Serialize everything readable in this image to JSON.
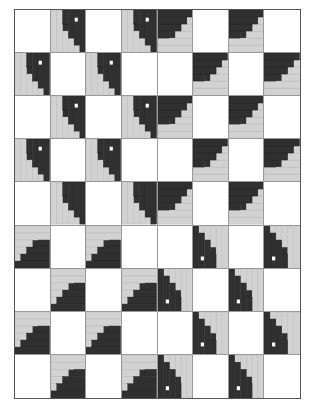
{
  "document": {
    "type": "quilt-pattern-diagram",
    "title": "Log Cabin Barn Raising Quilt Layout",
    "description": "Eight-by-nine checkerboard grid of alternating plain white setting squares and pieced log cabin blocks rotated to form a radiating barn-raising medallion."
  },
  "canvas": {
    "width": 324,
    "height": 411,
    "background": "#ffffff"
  },
  "frame": {
    "x": 14,
    "y": 9,
    "width": 287,
    "height": 390,
    "border_width": 1,
    "border_color": "#555555",
    "fill": "#ffffff"
  },
  "grid": {
    "columns": 8,
    "rows": 9,
    "cell_width": 35.875,
    "cell_height": 43.333,
    "gridlines": true,
    "gridline_color": "#9a9a9a"
  },
  "palette": {
    "white": "#ffffff",
    "light": "#d2d2d2",
    "light_edge": "#b4b4b4",
    "medium": "#8e8e8e",
    "dark": "#303030",
    "darker": "#1f1f1f",
    "outline": "#555555",
    "seam": "#9a9a9a",
    "dot": "#ffffff"
  },
  "block_types": {
    "plain": "plain white setting square",
    "log_cabin": "log cabin block, light half and dark half split on the diagonal"
  },
  "block_orientations": {
    "0": "dark corner top-right",
    "90": "dark corner bottom-right",
    "180": "dark corner bottom-left",
    "270": "dark corner top-left"
  },
  "layout": [
    [
      {
        "t": "plain"
      },
      {
        "t": "cabin",
        "rot": 0,
        "dot": true
      },
      {
        "t": "plain"
      },
      {
        "t": "cabin",
        "rot": 0,
        "dot": true
      },
      {
        "t": "cabin",
        "rot": 270,
        "dot": false
      },
      {
        "t": "plain"
      },
      {
        "t": "cabin",
        "rot": 270,
        "dot": false
      },
      {
        "t": "plain"
      }
    ],
    [
      {
        "t": "cabin",
        "rot": 0,
        "dot": true
      },
      {
        "t": "plain"
      },
      {
        "t": "cabin",
        "rot": 0,
        "dot": true
      },
      {
        "t": "plain"
      },
      {
        "t": "plain"
      },
      {
        "t": "cabin",
        "rot": 270,
        "dot": false
      },
      {
        "t": "plain"
      },
      {
        "t": "cabin",
        "rot": 270,
        "dot": false
      }
    ],
    [
      {
        "t": "plain"
      },
      {
        "t": "cabin",
        "rot": 0,
        "dot": true
      },
      {
        "t": "plain"
      },
      {
        "t": "cabin",
        "rot": 0,
        "dot": true
      },
      {
        "t": "cabin",
        "rot": 270,
        "dot": false
      },
      {
        "t": "plain"
      },
      {
        "t": "cabin",
        "rot": 270,
        "dot": false
      },
      {
        "t": "plain"
      }
    ],
    [
      {
        "t": "cabin",
        "rot": 0,
        "dot": true
      },
      {
        "t": "plain"
      },
      {
        "t": "cabin",
        "rot": 0,
        "dot": true
      },
      {
        "t": "plain"
      },
      {
        "t": "plain"
      },
      {
        "t": "cabin",
        "rot": 270,
        "dot": false
      },
      {
        "t": "plain"
      },
      {
        "t": "cabin",
        "rot": 270,
        "dot": false
      }
    ],
    [
      {
        "t": "plain"
      },
      {
        "t": "cabin",
        "rot": 0,
        "dot": false
      },
      {
        "t": "plain"
      },
      {
        "t": "cabin",
        "rot": 0,
        "dot": false
      },
      {
        "t": "cabin",
        "rot": 270,
        "dot": false
      },
      {
        "t": "plain"
      },
      {
        "t": "cabin",
        "rot": 270,
        "dot": false
      },
      {
        "t": "plain"
      }
    ],
    [
      {
        "t": "cabin",
        "rot": 90,
        "dot": false
      },
      {
        "t": "plain"
      },
      {
        "t": "cabin",
        "rot": 90,
        "dot": false
      },
      {
        "t": "plain"
      },
      {
        "t": "plain"
      },
      {
        "t": "cabin",
        "rot": 180,
        "dot": true
      },
      {
        "t": "plain"
      },
      {
        "t": "cabin",
        "rot": 180,
        "dot": true
      }
    ],
    [
      {
        "t": "plain"
      },
      {
        "t": "cabin",
        "rot": 90,
        "dot": false
      },
      {
        "t": "plain"
      },
      {
        "t": "cabin",
        "rot": 90,
        "dot": false
      },
      {
        "t": "cabin",
        "rot": 180,
        "dot": true
      },
      {
        "t": "plain"
      },
      {
        "t": "cabin",
        "rot": 180,
        "dot": true
      },
      {
        "t": "plain"
      }
    ],
    [
      {
        "t": "cabin",
        "rot": 90,
        "dot": false
      },
      {
        "t": "plain"
      },
      {
        "t": "cabin",
        "rot": 90,
        "dot": false
      },
      {
        "t": "plain"
      },
      {
        "t": "plain"
      },
      {
        "t": "cabin",
        "rot": 180,
        "dot": true
      },
      {
        "t": "plain"
      },
      {
        "t": "cabin",
        "rot": 180,
        "dot": true
      }
    ],
    [
      {
        "t": "plain"
      },
      {
        "t": "cabin",
        "rot": 90,
        "dot": false
      },
      {
        "t": "plain"
      },
      {
        "t": "cabin",
        "rot": 90,
        "dot": false
      },
      {
        "t": "cabin",
        "rot": 180,
        "dot": true
      },
      {
        "t": "plain"
      },
      {
        "t": "cabin",
        "rot": 180,
        "dot": true
      },
      {
        "t": "plain"
      }
    ]
  ],
  "log_cabin_block": {
    "unit_grid": 6,
    "note": "Block is drawn on a 6x6 unit grid. Light strips occupy the lower-left triangle half, dark strips the upper-right half, spiralling out from a small centre square.",
    "strips": [
      {
        "name": "centre-square",
        "shade": "dark",
        "x": 2,
        "y": 2,
        "w": 1,
        "h": 1
      },
      {
        "name": "log-1-light",
        "shade": "light",
        "x": 0,
        "y": 0,
        "w": 1,
        "h": 6
      },
      {
        "name": "log-2-light",
        "shade": "light",
        "x": 1,
        "y": 0,
        "w": 1,
        "h": 6
      },
      {
        "name": "log-3-light",
        "shade": "light",
        "x": 2,
        "y": 3,
        "w": 1,
        "h": 3
      },
      {
        "name": "log-4-light",
        "shade": "light",
        "x": 3,
        "y": 4,
        "w": 1,
        "h": 2
      },
      {
        "name": "log-5-light",
        "shade": "light",
        "x": 4,
        "y": 5,
        "w": 1,
        "h": 1
      },
      {
        "name": "log-6-dark",
        "shade": "dark",
        "x": 2,
        "y": 0,
        "w": 1,
        "h": 2
      },
      {
        "name": "log-7-dark",
        "shade": "dark",
        "x": 3,
        "y": 0,
        "w": 1,
        "h": 4
      },
      {
        "name": "log-8-dark",
        "shade": "dark",
        "x": 4,
        "y": 0,
        "w": 1,
        "h": 5
      },
      {
        "name": "log-9-dark",
        "shade": "dark",
        "x": 5,
        "y": 0,
        "w": 1,
        "h": 6
      }
    ],
    "dot": {
      "x": 4.1,
      "y": 1.1,
      "w": 0.55,
      "h": 0.55,
      "color": "#ffffff"
    }
  },
  "medallion": {
    "present": true,
    "description": "Four dark-cornered log cabin blocks meet at the quilt centre forming a large dark diamond medallion.",
    "center_row": 5,
    "center_col": 4
  }
}
